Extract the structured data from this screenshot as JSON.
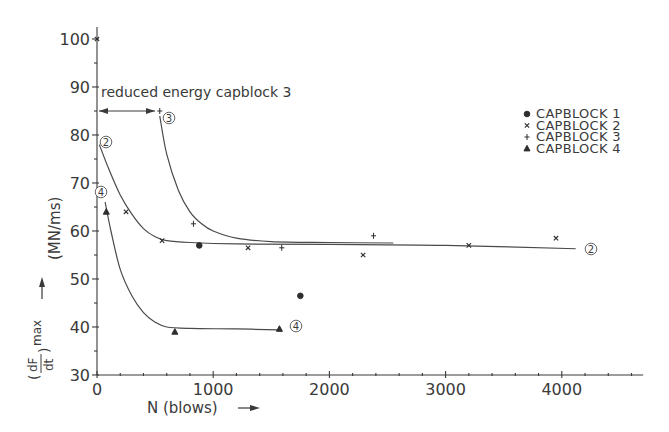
{
  "chart_data": {
    "type": "scatter",
    "title": "",
    "xlabel": "N (blows)",
    "ylabel": "(dF/dt)max (MN/ms)",
    "xlim": [
      0,
      4700
    ],
    "ylim": [
      30,
      100
    ],
    "x_ticks": [
      0,
      1000,
      2000,
      3000,
      4000
    ],
    "x_tick_labels": [
      "0",
      "1000",
      "2000",
      "3000",
      "4000"
    ],
    "y_ticks": [
      30,
      40,
      50,
      60,
      70,
      80,
      90,
      100
    ],
    "y_tick_labels": [
      "30",
      "40",
      "50",
      "60",
      "70",
      "80",
      "90",
      "100"
    ],
    "grid": false,
    "legend_position": "upper right",
    "annotation": "reduced energy capblock 3",
    "annotation_range_x": [
      0,
      540
    ],
    "series": [
      {
        "name": "CAPBLOCK 1",
        "marker": "filled-circle",
        "points": [
          [
            880,
            57
          ],
          [
            1750,
            46.5
          ]
        ]
      },
      {
        "name": "CAPBLOCK 2",
        "marker": "x",
        "points": [
          [
            0,
            100
          ],
          [
            250,
            64
          ],
          [
            560,
            58
          ],
          [
            1300,
            56.5
          ],
          [
            2290,
            55
          ],
          [
            3200,
            57
          ],
          [
            3950,
            58.5
          ]
        ],
        "fit_curve_label": "2",
        "fit_curve": [
          [
            20,
            78
          ],
          [
            100,
            73
          ],
          [
            200,
            67.5
          ],
          [
            300,
            63.5
          ],
          [
            400,
            60.5
          ],
          [
            500,
            58.8
          ],
          [
            600,
            58
          ],
          [
            800,
            57.6
          ],
          [
            1200,
            57.3
          ],
          [
            2000,
            57.2
          ],
          [
            3000,
            57
          ],
          [
            4120,
            56.3
          ]
        ]
      },
      {
        "name": "CAPBLOCK 3",
        "marker": "plus",
        "points": [
          [
            540,
            85
          ],
          [
            830,
            61.5
          ],
          [
            1590,
            56.5
          ],
          [
            2380,
            59
          ]
        ],
        "fit_curve_label": "3",
        "fit_curve": [
          [
            540,
            84
          ],
          [
            600,
            76
          ],
          [
            700,
            68.5
          ],
          [
            800,
            64
          ],
          [
            900,
            61.5
          ],
          [
            1000,
            60
          ],
          [
            1200,
            58.5
          ],
          [
            1500,
            57.8
          ],
          [
            2000,
            57.6
          ],
          [
            2550,
            57.5
          ]
        ]
      },
      {
        "name": "CAPBLOCK 4",
        "marker": "filled-triangle",
        "points": [
          [
            80,
            64
          ],
          [
            670,
            39
          ],
          [
            1570,
            39.6
          ]
        ],
        "fit_curve_label": "4",
        "fit_curve": [
          [
            70,
            66
          ],
          [
            120,
            60
          ],
          [
            200,
            52
          ],
          [
            300,
            46.5
          ],
          [
            400,
            43
          ],
          [
            500,
            41
          ],
          [
            600,
            40
          ],
          [
            800,
            39.7
          ],
          [
            1200,
            39.6
          ],
          [
            1570,
            39.4
          ]
        ]
      }
    ]
  },
  "labels": {
    "x_axis": "N (blows)",
    "x_axis_arrow": "→",
    "y_axis_main": "(MN/ms)",
    "y_axis_fraction_num": "dF",
    "y_axis_fraction_den": "dt",
    "y_axis_sub": "max",
    "annotation": "reduced energy capblock 3"
  },
  "legend": [
    {
      "label": "CAPBLOCK  1",
      "marker": "filled-circle"
    },
    {
      "label": "CAPBLOCK  2",
      "marker": "x"
    },
    {
      "label": "CAPBLOCK  3",
      "marker": "plus"
    },
    {
      "label": "CAPBLOCK  4",
      "marker": "filled-triangle"
    }
  ],
  "curve_labels": [
    "2",
    "3",
    "4",
    "2",
    "4"
  ]
}
